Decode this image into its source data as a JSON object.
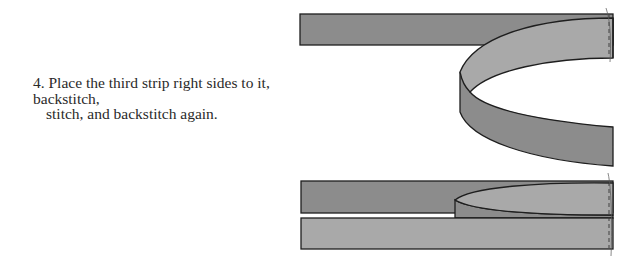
{
  "step": {
    "number": "4.",
    "line1": "4. Place the third strip right sides to it, backstitch,",
    "line2": "stitch, and backstitch again."
  },
  "figures": [
    {
      "name": "top-figure",
      "description": "third strip folded back in a curl over the joined strip"
    },
    {
      "name": "bottom-figure",
      "description": "third strip laid right sides together and stitched"
    }
  ],
  "colors": {
    "strip_dark": "#8c8c8c",
    "strip_light": "#a9a9a9",
    "outline": "#1e1e1e",
    "text": "#2a2a2a"
  }
}
